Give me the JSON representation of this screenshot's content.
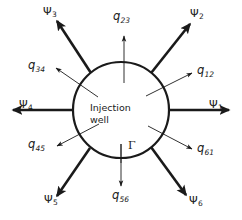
{
  "figure": {
    "type": "schematic-diagram",
    "background_color": "#ffffff",
    "stroke_color": "#1a1a1a",
    "center_label_line1": "Injection",
    "center_label_line2": "well",
    "boundary_symbol": "Γ"
  },
  "flux_labels": {
    "q12": {
      "text": "q",
      "sub": "12"
    },
    "q23": {
      "text": "q",
      "sub": "23"
    },
    "q34": {
      "text": "q",
      "sub": "34"
    },
    "q45": {
      "text": "q",
      "sub": "45"
    },
    "q56": {
      "text": "q",
      "sub": "56"
    },
    "q61": {
      "text": "q",
      "sub": "61"
    }
  },
  "stream_labels": {
    "psi1": {
      "text": "Ψ",
      "sub": "1"
    },
    "psi2": {
      "text": "Ψ",
      "sub": "2"
    },
    "psi3": {
      "text": "Ψ",
      "sub": "3"
    },
    "psi4": {
      "text": "Ψ",
      "sub": "4"
    },
    "psi5": {
      "text": "Ψ",
      "sub": "5"
    },
    "psi6": {
      "text": "Ψ",
      "sub": "6"
    }
  },
  "geometry": {
    "circle_center_x": 121,
    "circle_center_y": 110,
    "circle_radius": 48,
    "circle_stroke_width": 2.2,
    "stream_arrow_width": 2.6,
    "flux_arrow_width": 0.9
  }
}
